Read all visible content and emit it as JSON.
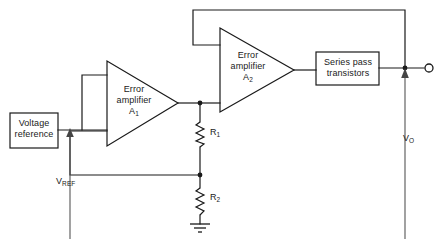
{
  "diagram": {
    "type": "schematic",
    "background_color": "#ffffff",
    "line_color": "#1a1a1a"
  },
  "blocks": {
    "voltage_reference": {
      "label_line1": "Voltage",
      "label_line2": "reference",
      "shape": "rectangle"
    },
    "series_pass": {
      "label_line1": "Series pass",
      "label_line2": "transistors",
      "shape": "rectangle"
    },
    "amplifier_1": {
      "label_line1": "Error",
      "label_line2": "amplifier",
      "designator": "A",
      "designator_sub": "1",
      "shape": "triangle"
    },
    "amplifier_2": {
      "label_line1": "Error",
      "label_line2": "amplifier",
      "designator": "A",
      "designator_sub": "2",
      "shape": "triangle"
    }
  },
  "components": {
    "resistor_1": {
      "label": "R",
      "label_sub": "1",
      "symbol": "zigzag-resistor"
    },
    "resistor_2": {
      "label": "R",
      "label_sub": "2",
      "symbol": "zigzag-resistor"
    },
    "ground": {
      "symbol": "ground-symbol"
    }
  },
  "signals": {
    "vref": {
      "label": "V",
      "label_sub": "REF",
      "direction": "up",
      "arrow": "arrow-up"
    },
    "vout": {
      "label": "V",
      "label_sub": "O",
      "direction": "up",
      "arrow": "arrow-up"
    }
  },
  "terminals": {
    "output": {
      "symbol": "open-circle-terminal"
    }
  },
  "nodes": {
    "amp1_output_node": "junction-dot",
    "divider_tap_node": "junction-dot",
    "output_node": "junction-dot"
  }
}
